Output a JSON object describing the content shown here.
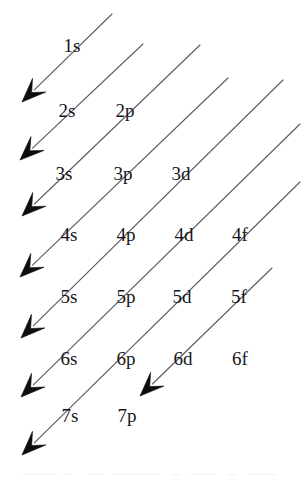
{
  "diagram": {
    "kind": "aufbau-diagonal-rule",
    "title": "",
    "background_color": "#ffffff",
    "label_color": "#16161a",
    "line_color": "#5c5c66",
    "arrow_color": "#0d0d10",
    "canvas": {
      "width": 306,
      "height": 478
    },
    "rows": [
      {
        "n": 1,
        "y": 45,
        "labels": [
          {
            "text": "1s",
            "x": 72,
            "y": 45,
            "subshell": "s"
          }
        ]
      },
      {
        "n": 2,
        "y": 110,
        "labels": [
          {
            "text": "2s",
            "x": 67,
            "y": 110,
            "subshell": "s"
          },
          {
            "text": "2p",
            "x": 125,
            "y": 110,
            "subshell": "p"
          }
        ]
      },
      {
        "n": 3,
        "y": 173,
        "labels": [
          {
            "text": "3s",
            "x": 64,
            "y": 173,
            "subshell": "s"
          },
          {
            "text": "3p",
            "x": 123,
            "y": 173,
            "subshell": "p"
          },
          {
            "text": "3d",
            "x": 181,
            "y": 173,
            "subshell": "d"
          }
        ]
      },
      {
        "n": 4,
        "y": 234,
        "labels": [
          {
            "text": "4s",
            "x": 69,
            "y": 234,
            "subshell": "s"
          },
          {
            "text": "4p",
            "x": 126,
            "y": 234,
            "subshell": "p"
          },
          {
            "text": "4d",
            "x": 184,
            "y": 234,
            "subshell": "d"
          },
          {
            "text": "4f",
            "x": 240,
            "y": 234,
            "subshell": "f"
          }
        ]
      },
      {
        "n": 5,
        "y": 296,
        "labels": [
          {
            "text": "5s",
            "x": 69,
            "y": 296,
            "subshell": "s"
          },
          {
            "text": "5p",
            "x": 126,
            "y": 296,
            "subshell": "p"
          },
          {
            "text": "5d",
            "x": 182,
            "y": 296,
            "subshell": "d"
          },
          {
            "text": "5f",
            "x": 239,
            "y": 296,
            "subshell": "f"
          }
        ]
      },
      {
        "n": 6,
        "y": 358,
        "labels": [
          {
            "text": "6s",
            "x": 69,
            "y": 358,
            "subshell": "s"
          },
          {
            "text": "6p",
            "x": 126,
            "y": 358,
            "subshell": "p"
          },
          {
            "text": "6d",
            "x": 183,
            "y": 358,
            "subshell": "d"
          },
          {
            "text": "6f",
            "x": 240,
            "y": 358,
            "subshell": "f"
          }
        ]
      },
      {
        "n": 7,
        "y": 415,
        "labels": [
          {
            "text": "7s",
            "x": 70,
            "y": 415,
            "subshell": "s"
          },
          {
            "text": "7p",
            "x": 127,
            "y": 415,
            "subshell": "p"
          }
        ]
      }
    ],
    "arrows": [
      {
        "name": "arrow-1s",
        "fill_order": "1s",
        "start": {
          "x": 112,
          "y": 14
        },
        "end": {
          "x": 22,
          "y": 102
        },
        "has_arrowhead": true
      },
      {
        "name": "arrow-2s",
        "fill_order": "2s",
        "start": {
          "x": 143,
          "y": 44
        },
        "end": {
          "x": 20,
          "y": 160
        },
        "has_arrowhead": true
      },
      {
        "name": "arrow-2p-3s",
        "fill_order": "2p, 3s",
        "start": {
          "x": 200,
          "y": 45
        },
        "end": {
          "x": 22,
          "y": 216
        },
        "has_arrowhead": true
      },
      {
        "name": "arrow-3p-4s",
        "fill_order": "3p, 4s",
        "start": {
          "x": 228,
          "y": 78
        },
        "end": {
          "x": 20,
          "y": 277
        },
        "has_arrowhead": true
      },
      {
        "name": "arrow-3d-4p-5s",
        "fill_order": "3d, 4p, 5s",
        "start": {
          "x": 283,
          "y": 80
        },
        "end": {
          "x": 21,
          "y": 338
        },
        "has_arrowhead": true
      },
      {
        "name": "arrow-4d-5p-6s",
        "fill_order": "4d, 5p, 6s",
        "start": {
          "x": 300,
          "y": 124
        },
        "end": {
          "x": 21,
          "y": 397
        },
        "has_arrowhead": true
      },
      {
        "name": "arrow-4f-5d-6p-7s",
        "fill_order": "4f, 5d, 6p, 7s",
        "start": {
          "x": 300,
          "y": 182
        },
        "end": {
          "x": 22,
          "y": 455
        },
        "has_arrowhead": true
      },
      {
        "name": "arrow-5f-6d-7p",
        "fill_order": "5f, 6d, 7p",
        "start": {
          "x": 272,
          "y": 268
        },
        "end": {
          "x": 140,
          "y": 396
        },
        "has_arrowhead": true
      }
    ],
    "bottom_artifacts": [
      {
        "x": 22,
        "y": 474,
        "width": 34
      },
      {
        "x": 62,
        "y": 474,
        "width": 10
      },
      {
        "x": 88,
        "y": 474,
        "width": 14
      },
      {
        "x": 112,
        "y": 474,
        "width": 48
      },
      {
        "x": 172,
        "y": 474,
        "width": 8
      },
      {
        "x": 190,
        "y": 474,
        "width": 26
      },
      {
        "x": 228,
        "y": 474,
        "width": 8
      },
      {
        "x": 248,
        "y": 474,
        "width": 28
      }
    ]
  }
}
